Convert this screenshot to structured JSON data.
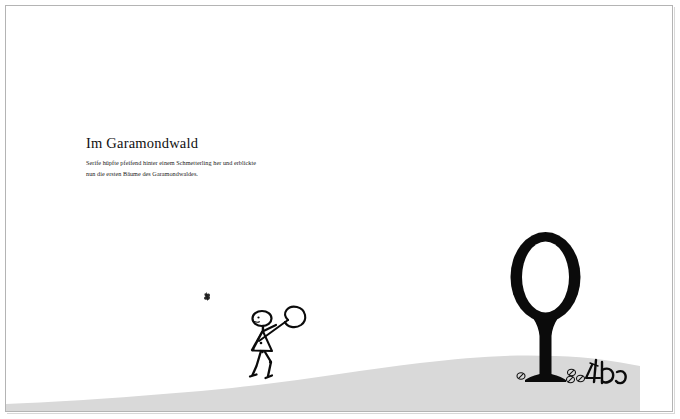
{
  "page": {
    "background_color": "#ffffff",
    "frame_color": "#b4b4b4",
    "ink_color": "#111111",
    "ground_color": "#d9d9d9"
  },
  "text": {
    "headline": "Im Garamondwald",
    "body_lines": [
      "Serife hüpfte pfeifend hinter einem Schmetterling her und erblickte",
      "nun die ersten Bäume des Garamondwaldes."
    ]
  },
  "illustration": {
    "title": "Im Garamondwald scene",
    "elements": [
      {
        "name": "ground-hill",
        "label": "hill"
      },
      {
        "name": "letter-tree",
        "label": "Q"
      },
      {
        "name": "stick-figure",
        "label": "Serife"
      },
      {
        "name": "butterfly",
        "label": "Schmetterling"
      },
      {
        "name": "ground-glyphs",
        "label": "&co"
      }
    ]
  }
}
